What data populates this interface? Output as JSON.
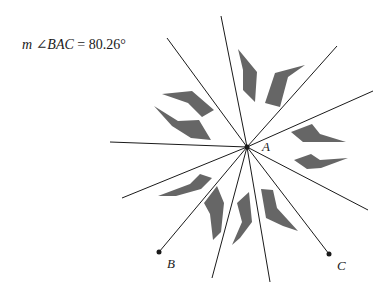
{
  "measurement": {
    "prefix": "m",
    "angle_symbol": "∠",
    "angle_name": "BAC",
    "equals": "=",
    "value": "80.26°"
  },
  "points": {
    "A": {
      "label": "A",
      "x": 247,
      "y": 147
    },
    "B": {
      "label": "B",
      "x": 159,
      "y": 252
    },
    "C": {
      "label": "C",
      "x": 329,
      "y": 254
    }
  },
  "colors": {
    "line": "#1a1a1a",
    "shape_fill": "#666666",
    "background": "#ffffff"
  }
}
